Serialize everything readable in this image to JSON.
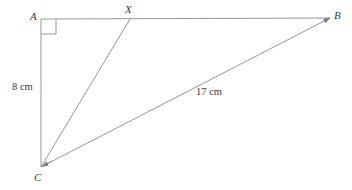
{
  "diagram": {
    "type": "geometry-figure",
    "stroke_color": "#7a7a7a",
    "label_color": "#3a3a3a",
    "background_color": "#ffffff",
    "vertices": [
      {
        "id": "A",
        "label": "A",
        "x": 41,
        "y": 19,
        "right_angle": true
      },
      {
        "id": "X",
        "label": "X",
        "x": 130,
        "y": 19,
        "right_angle": false
      },
      {
        "id": "B",
        "label": "B",
        "x": 330,
        "y": 18,
        "right_angle": false
      },
      {
        "id": "C",
        "label": "C",
        "x": 41,
        "y": 167,
        "right_angle": false
      }
    ],
    "segments": [
      {
        "id": "AB",
        "from": "A",
        "to": "B",
        "label": ""
      },
      {
        "id": "AC",
        "from": "A",
        "to": "C",
        "label": "8 cm"
      },
      {
        "id": "CX",
        "from": "C",
        "to": "X",
        "label": ""
      },
      {
        "id": "CB",
        "from": "C",
        "to": "B",
        "label": "17 cm"
      }
    ],
    "measurements": [
      {
        "id": "ac-length",
        "segment": "AC",
        "value": "8 cm"
      },
      {
        "id": "cb-length",
        "segment": "CB",
        "value": "17 cm"
      }
    ],
    "right_angle_marker": {
      "at": "A",
      "size": 15
    }
  }
}
